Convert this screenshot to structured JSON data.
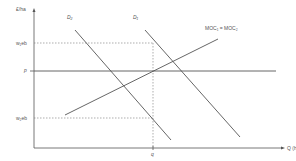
{
  "diagram": {
    "type": "economics supply-demand diagram",
    "axes": {
      "y_label": "£/ha",
      "x_label": "Q (ha)"
    },
    "price_levels": {
      "w1": "w₁eb",
      "p": "p",
      "w2": "w₂eb"
    },
    "quantity_marker": "q",
    "curves": {
      "d2": "D₂",
      "d1": "D₁",
      "moc": "MOC₁ = MOC₂"
    },
    "colors": {
      "line": "#555555",
      "dashed": "#777777",
      "background": "#ffffff"
    }
  }
}
